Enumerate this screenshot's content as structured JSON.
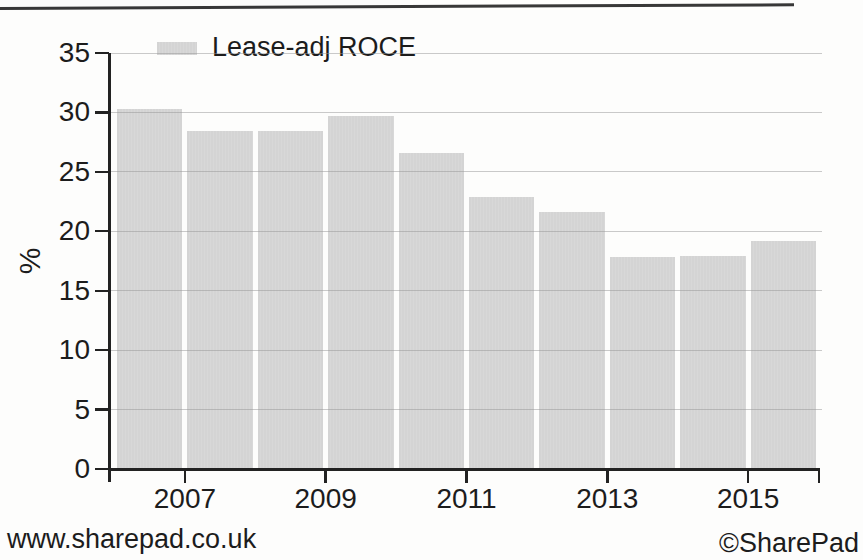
{
  "footer": {
    "left": "www.sharepad.co.uk",
    "right": "©SharePad"
  },
  "chart_data": {
    "type": "bar",
    "title": "",
    "legend": [
      {
        "label": "Lease-adj ROCE",
        "color": "#d6d6d6",
        "position": "top-left"
      }
    ],
    "ylabel": "%",
    "xlabel": "",
    "categories": [
      2006,
      2007,
      2008,
      2009,
      2010,
      2011,
      2012,
      2013,
      2014,
      2015
    ],
    "values": [
      30.3,
      28.4,
      28.4,
      29.7,
      26.6,
      22.9,
      21.6,
      17.8,
      17.9,
      19.2
    ],
    "ylim": [
      0,
      35
    ],
    "yticks": [
      0,
      5,
      10,
      15,
      20,
      25,
      30,
      35
    ],
    "x_axis_tick_labels": [
      "2007",
      "2009",
      "2011",
      "2013",
      "2015"
    ],
    "grid": true,
    "colors": {
      "bar": "#d6d6d6",
      "gridline": "#c7c7c7",
      "axis": "#222222",
      "text": "#1c1c1c",
      "background": "#fdfdfc"
    }
  }
}
